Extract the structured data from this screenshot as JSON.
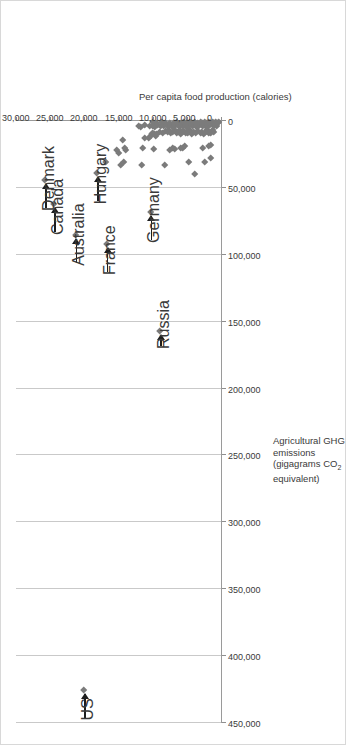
{
  "chart_data": {
    "type": "scatter",
    "title": "",
    "orientation": "rotated-90-ccw",
    "xlabel": "Per capita food production (calories)",
    "ylabel_lines": [
      "Agricultural GHG",
      "emissions",
      "(gigagrams CO2",
      "equivalent)"
    ],
    "ylabel_line1": "Agricultural GHG",
    "ylabel_line2": "emissions",
    "ylabel_line3_pre": "(gigagrams CO",
    "ylabel_line3_sub": "2",
    "ylabel_line4": "equivalent)",
    "xlim": [
      0,
      30000
    ],
    "ylim": [
      0,
      450000
    ],
    "xticks": [
      0,
      5000,
      10000,
      15000,
      20000,
      25000,
      30000
    ],
    "xtick_labels": [
      "0",
      "5,000",
      "10,000",
      "15,000",
      "20,000",
      "25,000",
      "30,000"
    ],
    "yticks": [
      0,
      50000,
      100000,
      150000,
      200000,
      250000,
      300000,
      350000,
      400000,
      450000
    ],
    "ytick_labels": [
      "0",
      "50,000",
      "100,000",
      "150,000",
      "200,000",
      "250,000",
      "300,000",
      "350,000",
      "400,000",
      "450,000"
    ],
    "grid": "y-major-only",
    "legend": "none",
    "marker": "diamond",
    "marker_color": "#7b7b7b",
    "gridline_color": "#c9c9c9",
    "axis_color": "#9a9a9a",
    "annotation_color": "#1d1d1d",
    "annotations": [
      {
        "label": "US",
        "x": 20000,
        "y": 425000
      },
      {
        "label": "Russia",
        "x": 8900,
        "y": 157000
      },
      {
        "label": "Germany",
        "x": 10300,
        "y": 68000
      },
      {
        "label": "France",
        "x": 16700,
        "y": 92000
      },
      {
        "label": "Australia",
        "x": 21300,
        "y": 85000
      },
      {
        "label": "Canada",
        "x": 24400,
        "y": 62000
      },
      {
        "label": "Denmark",
        "x": 25700,
        "y": 44000
      },
      {
        "label": "Hungary",
        "x": 18100,
        "y": 39000
      }
    ],
    "points": [
      {
        "x": 20000,
        "y": 425000,
        "name": "US"
      },
      {
        "x": 8900,
        "y": 157000,
        "name": "Russia"
      },
      {
        "x": 16700,
        "y": 92000,
        "name": "France"
      },
      {
        "x": 21300,
        "y": 85000,
        "name": "Australia"
      },
      {
        "x": 10300,
        "y": 68000,
        "name": "Germany"
      },
      {
        "x": 24400,
        "y": 62000,
        "name": "Canada"
      },
      {
        "x": 25700,
        "y": 44000,
        "name": "Denmark"
      },
      {
        "x": 18100,
        "y": 39000,
        "name": "Hungary"
      },
      {
        "x": 3800,
        "y": 40000
      },
      {
        "x": 16800,
        "y": 31000
      },
      {
        "x": 14600,
        "y": 33000
      },
      {
        "x": 14200,
        "y": 31000
      },
      {
        "x": 11500,
        "y": 33000
      },
      {
        "x": 8200,
        "y": 33000
      },
      {
        "x": 4700,
        "y": 31000
      },
      {
        "x": 2400,
        "y": 31000
      },
      {
        "x": 1500,
        "y": 28000
      },
      {
        "x": 14900,
        "y": 24000
      },
      {
        "x": 15200,
        "y": 22000
      },
      {
        "x": 13900,
        "y": 22000
      },
      {
        "x": 14100,
        "y": 20000
      },
      {
        "x": 11400,
        "y": 20000
      },
      {
        "x": 9800,
        "y": 21000
      },
      {
        "x": 7400,
        "y": 22000
      },
      {
        "x": 7100,
        "y": 20000
      },
      {
        "x": 6700,
        "y": 21000
      },
      {
        "x": 5900,
        "y": 20000
      },
      {
        "x": 5500,
        "y": 20000
      },
      {
        "x": 5300,
        "y": 19000
      },
      {
        "x": 2600,
        "y": 20000
      },
      {
        "x": 1800,
        "y": 19000
      },
      {
        "x": 1400,
        "y": 18000
      },
      {
        "x": 14300,
        "y": 14000
      },
      {
        "x": 11200,
        "y": 13000
      },
      {
        "x": 10600,
        "y": 13000
      },
      {
        "x": 10300,
        "y": 11000
      },
      {
        "x": 10100,
        "y": 10000
      },
      {
        "x": 9900,
        "y": 9000
      },
      {
        "x": 9700,
        "y": 9500
      },
      {
        "x": 9500,
        "y": 11000
      },
      {
        "x": 9300,
        "y": 10000
      },
      {
        "x": 8900,
        "y": 8000
      },
      {
        "x": 8500,
        "y": 9000
      },
      {
        "x": 8100,
        "y": 7500
      },
      {
        "x": 7800,
        "y": 8500
      },
      {
        "x": 7600,
        "y": 7000
      },
      {
        "x": 7300,
        "y": 9000
      },
      {
        "x": 7000,
        "y": 8000
      },
      {
        "x": 6700,
        "y": 7000
      },
      {
        "x": 6400,
        "y": 9000
      },
      {
        "x": 6200,
        "y": 8000
      },
      {
        "x": 6000,
        "y": 7000
      },
      {
        "x": 5800,
        "y": 9500
      },
      {
        "x": 5600,
        "y": 8500
      },
      {
        "x": 5400,
        "y": 7500
      },
      {
        "x": 5200,
        "y": 9000
      },
      {
        "x": 5000,
        "y": 8000
      },
      {
        "x": 4800,
        "y": 9000
      },
      {
        "x": 4600,
        "y": 7000
      },
      {
        "x": 4400,
        "y": 8500
      },
      {
        "x": 4200,
        "y": 9500
      },
      {
        "x": 4000,
        "y": 8000
      },
      {
        "x": 3600,
        "y": 9000
      },
      {
        "x": 3300,
        "y": 7500
      },
      {
        "x": 3000,
        "y": 9000
      },
      {
        "x": 2800,
        "y": 8000
      },
      {
        "x": 2500,
        "y": 9500
      },
      {
        "x": 2200,
        "y": 8500
      },
      {
        "x": 2000,
        "y": 7000
      },
      {
        "x": 1800,
        "y": 9000
      },
      {
        "x": 1600,
        "y": 8000
      },
      {
        "x": 1400,
        "y": 9000
      },
      {
        "x": 1200,
        "y": 7000
      },
      {
        "x": 1000,
        "y": 8500
      },
      {
        "x": 12000,
        "y": 3500
      },
      {
        "x": 11700,
        "y": 4500
      },
      {
        "x": 11100,
        "y": 3000
      },
      {
        "x": 10400,
        "y": 4000
      },
      {
        "x": 10000,
        "y": 3500
      },
      {
        "x": 9600,
        "y": 4500
      },
      {
        "x": 9200,
        "y": 3000
      },
      {
        "x": 8800,
        "y": 4000
      },
      {
        "x": 8400,
        "y": 3500
      },
      {
        "x": 8000,
        "y": 2500
      },
      {
        "x": 7700,
        "y": 4000
      },
      {
        "x": 7400,
        "y": 3000
      },
      {
        "x": 7100,
        "y": 4500
      },
      {
        "x": 6800,
        "y": 3500
      },
      {
        "x": 6500,
        "y": 2500
      },
      {
        "x": 6200,
        "y": 4000
      },
      {
        "x": 5900,
        "y": 3000
      },
      {
        "x": 5600,
        "y": 4000
      },
      {
        "x": 5300,
        "y": 3000
      },
      {
        "x": 5000,
        "y": 4500
      },
      {
        "x": 4700,
        "y": 3500
      },
      {
        "x": 4400,
        "y": 2500
      },
      {
        "x": 4100,
        "y": 4000
      },
      {
        "x": 3800,
        "y": 3000
      },
      {
        "x": 3500,
        "y": 4500
      },
      {
        "x": 3200,
        "y": 3500
      },
      {
        "x": 2900,
        "y": 2500
      },
      {
        "x": 2600,
        "y": 4000
      },
      {
        "x": 2300,
        "y": 3000
      },
      {
        "x": 2000,
        "y": 4500
      },
      {
        "x": 1700,
        "y": 3500
      },
      {
        "x": 1400,
        "y": 2500
      },
      {
        "x": 1100,
        "y": 4000
      },
      {
        "x": 800,
        "y": 3000
      },
      {
        "x": 600,
        "y": 3500
      },
      {
        "x": 9900,
        "y": 1000
      },
      {
        "x": 9300,
        "y": 1500
      },
      {
        "x": 8600,
        "y": 1000
      },
      {
        "x": 8000,
        "y": 1800
      },
      {
        "x": 7400,
        "y": 1200
      },
      {
        "x": 6900,
        "y": 1500
      },
      {
        "x": 6400,
        "y": 900
      },
      {
        "x": 5900,
        "y": 1600
      },
      {
        "x": 5400,
        "y": 1100
      },
      {
        "x": 5000,
        "y": 1800
      },
      {
        "x": 4600,
        "y": 1000
      },
      {
        "x": 4200,
        "y": 1500
      },
      {
        "x": 3800,
        "y": 900
      },
      {
        "x": 3400,
        "y": 1700
      },
      {
        "x": 3000,
        "y": 1100
      },
      {
        "x": 2700,
        "y": 1500
      },
      {
        "x": 2400,
        "y": 800
      },
      {
        "x": 2100,
        "y": 1600
      },
      {
        "x": 1800,
        "y": 1000
      },
      {
        "x": 1500,
        "y": 1400
      },
      {
        "x": 1200,
        "y": 900
      },
      {
        "x": 900,
        "y": 1500
      },
      {
        "x": 700,
        "y": 1000
      },
      {
        "x": 500,
        "y": 1400
      },
      {
        "x": 300,
        "y": 900
      }
    ]
  }
}
